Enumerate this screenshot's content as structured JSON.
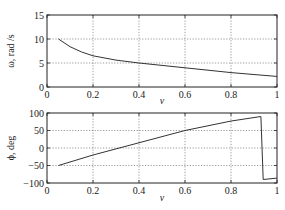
{
  "chart_data": [
    {
      "type": "line",
      "title": "",
      "xlabel": "v",
      "ylabel": "ω, rad /s",
      "xlim": [
        0,
        1
      ],
      "ylim": [
        0,
        15
      ],
      "xticks": [
        0,
        0.2,
        0.4,
        0.6,
        0.8,
        1
      ],
      "xtick_labels": [
        "0",
        "0.2",
        "0.4",
        "0.6",
        "0.8",
        "1"
      ],
      "yticks": [
        0,
        5,
        10,
        15
      ],
      "ytick_labels": [
        "0",
        "5",
        "10",
        "15"
      ],
      "grid": true,
      "series": [
        {
          "name": "omega",
          "x": [
            0.05,
            0.1,
            0.15,
            0.2,
            0.3,
            0.4,
            0.5,
            0.6,
            0.7,
            0.8,
            0.9,
            1.0
          ],
          "y": [
            10.0,
            8.4,
            7.3,
            6.5,
            5.6,
            5.0,
            4.5,
            4.0,
            3.5,
            3.0,
            2.6,
            2.2
          ]
        }
      ]
    },
    {
      "type": "line",
      "title": "",
      "xlabel": "v",
      "ylabel": "ϕ, deg",
      "xlim": [
        0,
        1
      ],
      "ylim": [
        -100,
        100
      ],
      "xticks": [
        0,
        0.2,
        0.4,
        0.6,
        0.8,
        1
      ],
      "xtick_labels": [
        "0",
        "0.2",
        "0.4",
        "0.6",
        "0.8",
        "1"
      ],
      "yticks": [
        -100,
        -50,
        0,
        50,
        100
      ],
      "ytick_labels": [
        "−100",
        "−50",
        "0",
        "50",
        "100"
      ],
      "grid": true,
      "series": [
        {
          "name": "phi",
          "x": [
            0.05,
            0.2,
            0.4,
            0.6,
            0.8,
            0.93,
            0.94,
            1.0
          ],
          "y": [
            -50,
            -20,
            15,
            50,
            77,
            90,
            -90,
            -86
          ]
        }
      ]
    }
  ],
  "colors": {
    "line": "#333333",
    "axis": "#222222",
    "grid": "#555555"
  }
}
